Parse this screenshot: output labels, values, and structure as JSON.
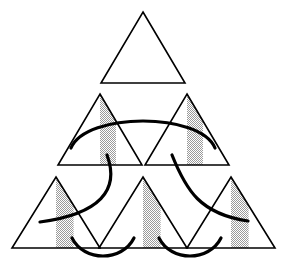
{
  "figure": {
    "canvas": {
      "width": 286,
      "height": 266,
      "background": "#ffffff"
    },
    "style": {
      "triangle_stroke": "#000000",
      "triangle_stroke_width": 1.6,
      "triangle_fill": "#ffffff",
      "shade_fill": "#c9c9c9",
      "shade_pattern": "checkerboard-dither-50",
      "arc_stroke": "#000000",
      "arc_stroke_width": 3.2,
      "arc_fill": "none",
      "arc_linecap": "round"
    },
    "triangles": [
      {
        "name": "top",
        "row": 1,
        "col": 1,
        "apex_x": 143,
        "apex_y": 12,
        "base_y": 83,
        "half_width": 42,
        "shaded": false,
        "shade_left_frac": 0.0,
        "shade_right_frac": 0.0
      },
      {
        "name": "middle-left",
        "row": 2,
        "col": 1,
        "apex_x": 100,
        "apex_y": 94,
        "base_y": 165,
        "half_width": 42,
        "shaded": true,
        "shade_left_frac": 0.0,
        "shade_right_frac": 0.38
      },
      {
        "name": "middle-right",
        "row": 2,
        "col": 2,
        "apex_x": 187,
        "apex_y": 94,
        "base_y": 165,
        "half_width": 42,
        "shaded": true,
        "shade_left_frac": 0.0,
        "shade_right_frac": 0.38
      },
      {
        "name": "bottom-left",
        "row": 3,
        "col": 1,
        "apex_x": 56,
        "apex_y": 177,
        "base_y": 248,
        "half_width": 44,
        "shaded": true,
        "shade_left_frac": 0.0,
        "shade_right_frac": 0.4
      },
      {
        "name": "bottom-middle",
        "row": 3,
        "col": 2,
        "apex_x": 143,
        "apex_y": 177,
        "base_y": 248,
        "half_width": 44,
        "shaded": true,
        "shade_left_frac": 0.0,
        "shade_right_frac": 0.4
      },
      {
        "name": "bottom-right",
        "row": 3,
        "col": 3,
        "apex_x": 231,
        "apex_y": 177,
        "base_y": 248,
        "half_width": 44,
        "shaded": true,
        "shade_left_frac": 0.0,
        "shade_right_frac": 0.4
      }
    ],
    "arcs": [
      {
        "name": "arc-middle-span",
        "d": "M 71 148 C 86 112, 200 112, 215 148"
      },
      {
        "name": "arc-left-diagonal",
        "d": "M 107 155 C 120 190, 100 214, 40 222"
      },
      {
        "name": "arc-right-diagonal",
        "d": "M 172 155 C 186 190, 200 214, 248 221"
      },
      {
        "name": "arc-bottom-left-cusp",
        "d": "M 72 238 C 84 262, 122 262, 134 238"
      },
      {
        "name": "arc-bottom-right-cusp",
        "d": "M 159 238 C 171 262, 209 262, 221 238"
      }
    ]
  }
}
